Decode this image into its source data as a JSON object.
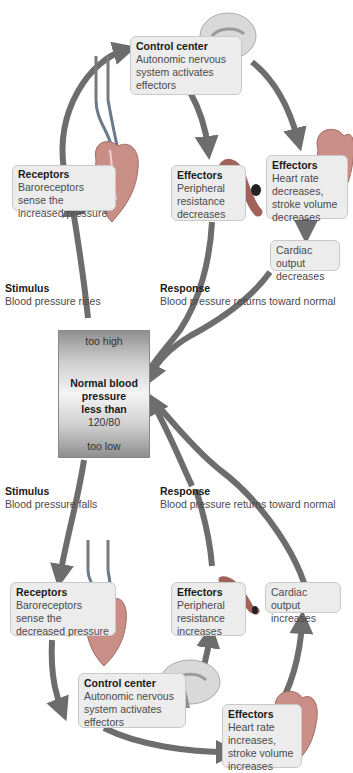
{
  "colors": {
    "arrow": "#6d6d6d",
    "box_fill": "#ececec",
    "box_border": "#c9c9c9",
    "heart": "#c98f86",
    "brain": "#d8d8d8",
    "vessel": "#a0625b"
  },
  "top": {
    "control_center": {
      "title": "Control center",
      "lines": [
        "Autonomic nervous",
        "system activates",
        "effectors"
      ]
    },
    "receptors": {
      "title": "Receptors",
      "lines": [
        "Baroreceptors",
        "sense the",
        "increased pressure"
      ]
    },
    "effectors_vessel": {
      "title": "Effectors",
      "lines": [
        "Peripheral",
        "resistance",
        "decreases"
      ]
    },
    "effectors_heart": {
      "title": "Effectors",
      "lines": [
        "Heart rate",
        "decreases,",
        "stroke volume",
        "decreases"
      ]
    },
    "cardiac_output": {
      "lines": [
        "Cardiac output",
        "decreases"
      ]
    },
    "stimulus": {
      "title": "Stimulus",
      "text": "Blood pressure rises"
    },
    "response": {
      "title": "Response",
      "text": "Blood pressure returns toward normal"
    }
  },
  "center": {
    "too_high": "too high",
    "title_lines": [
      "Normal blood",
      "pressure",
      "less than"
    ],
    "value": "120/80",
    "too_low": "too low"
  },
  "bottom": {
    "stimulus": {
      "title": "Stimulus",
      "text": "Blood pressure falls"
    },
    "response": {
      "title": "Response",
      "text": "Blood pressure returns toward normal"
    },
    "receptors": {
      "title": "Receptors",
      "lines": [
        "Baroreceptors",
        "sense the",
        "decreased pressure"
      ]
    },
    "effectors_vessel": {
      "title": "Effectors",
      "lines": [
        "Peripheral",
        "resistance",
        "increases"
      ]
    },
    "cardiac_output": {
      "lines": [
        "Cardiac output",
        "increases"
      ]
    },
    "control_center": {
      "title": "Control center",
      "lines": [
        "Autonomic nervous",
        "system activates",
        "effectors"
      ]
    },
    "effectors_heart": {
      "title": "Effectors",
      "lines": [
        "Heart rate",
        "increases,",
        "stroke volume",
        "increases"
      ]
    }
  }
}
